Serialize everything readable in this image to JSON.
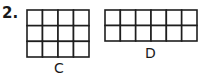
{
  "problem": {
    "number": "2.",
    "grids": [
      {
        "label": "C",
        "columns": 4,
        "rows": 3
      },
      {
        "label": "D",
        "columns": 6,
        "rows": 2
      }
    ],
    "line_color": "#1e1e1e"
  }
}
